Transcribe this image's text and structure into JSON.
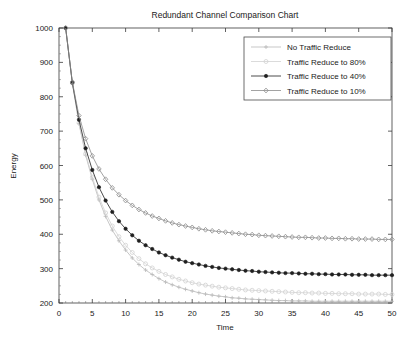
{
  "chart_data": {
    "type": "line",
    "title": "Redundant Channel Comparison Chart",
    "xlabel": "Time",
    "ylabel": "Energy",
    "xlim": [
      0,
      50
    ],
    "ylim": [
      200,
      1000
    ],
    "xticks": [
      0,
      5,
      10,
      15,
      20,
      25,
      30,
      35,
      40,
      45,
      50
    ],
    "yticks": [
      200,
      300,
      400,
      500,
      600,
      700,
      800,
      900,
      1000
    ],
    "grid": false,
    "legend_position": "top-right",
    "x": [
      1,
      2,
      3,
      4,
      5,
      6,
      7,
      8,
      9,
      10,
      11,
      12,
      13,
      14,
      15,
      16,
      17,
      18,
      19,
      20,
      21,
      22,
      23,
      24,
      25,
      26,
      27,
      28,
      29,
      30,
      31,
      32,
      33,
      34,
      35,
      36,
      37,
      38,
      39,
      40,
      41,
      42,
      43,
      44,
      45,
      46,
      47,
      48,
      49,
      50
    ],
    "series": [
      {
        "name": "No Traffic Reduce",
        "marker": "plus",
        "color": "#b9b9b9",
        "asymptote": 205,
        "values": [
          1000,
          840,
          722,
          630,
          560,
          500,
          452,
          412,
          381,
          354,
          331,
          312,
          296,
          283,
          271,
          261,
          253,
          246,
          240,
          235,
          230,
          226,
          223,
          220,
          218,
          215,
          214,
          212,
          211,
          210,
          209,
          208,
          207,
          207,
          206,
          206,
          206,
          205,
          205,
          205,
          205,
          205,
          205,
          205,
          205,
          205,
          205,
          205,
          205,
          205
        ]
      },
      {
        "name": "Traffic Reduce to 80%",
        "marker": "circle",
        "color": "#d2d2d2",
        "asymptote": 219,
        "values": [
          1000,
          840,
          724,
          634,
          566,
          508,
          462,
          424,
          393,
          368,
          347,
          329,
          314,
          302,
          292,
          283,
          276,
          269,
          264,
          259,
          255,
          252,
          249,
          246,
          244,
          242,
          240,
          238,
          237,
          236,
          235,
          234,
          233,
          232,
          231,
          230,
          230,
          229,
          229,
          228,
          228,
          227,
          227,
          227,
          226,
          226,
          226,
          226,
          225,
          225
        ]
      },
      {
        "name": "Traffic Reduce to 40%",
        "marker": "star",
        "color": "#1f1f1f",
        "asymptote": 264,
        "values": [
          1000,
          841,
          733,
          650,
          587,
          537,
          498,
          465,
          438,
          416,
          397,
          381,
          368,
          357,
          347,
          339,
          332,
          326,
          320,
          316,
          312,
          308,
          305,
          302,
          300,
          298,
          296,
          294,
          293,
          291,
          290,
          289,
          288,
          287,
          287,
          286,
          285,
          285,
          284,
          284,
          283,
          283,
          283,
          282,
          282,
          282,
          281,
          281,
          281,
          281
        ]
      },
      {
        "name": "Traffic Reduce to 10%",
        "marker": "diamond",
        "color": "#8c8c8c",
        "asymptote": 365,
        "values": [
          1000,
          843,
          745,
          678,
          628,
          590,
          560,
          535,
          515,
          498,
          484,
          472,
          462,
          453,
          446,
          439,
          433,
          428,
          424,
          420,
          416,
          413,
          410,
          408,
          406,
          404,
          402,
          400,
          399,
          397,
          396,
          395,
          394,
          393,
          392,
          391,
          391,
          390,
          389,
          389,
          388,
          388,
          387,
          387,
          386,
          386,
          386,
          385,
          385,
          385
        ]
      }
    ]
  }
}
